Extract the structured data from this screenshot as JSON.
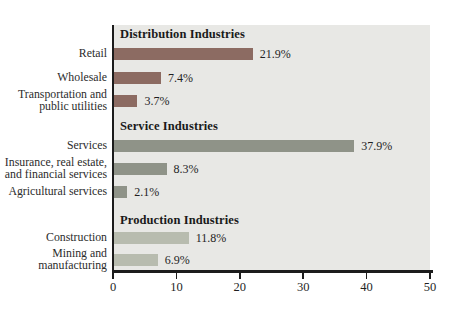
{
  "chart_data": {
    "type": "bar",
    "orientation": "horizontal",
    "title": "",
    "xlabel": "",
    "ylabel": "",
    "xlim": [
      0,
      50
    ],
    "x_ticks": [
      0,
      10,
      20,
      30,
      40,
      50
    ],
    "x_tick_labels": [
      "0",
      "10",
      "20",
      "30",
      "40",
      "50"
    ],
    "grid": false,
    "legend": "none",
    "plot_bg_color": "#e8e8e5",
    "axis_color": "#1c1c1c",
    "value_suffix": "%",
    "groups": [
      {
        "header": "Distribution Industries",
        "color": "#8c6b62",
        "items": [
          {
            "label": "Retail",
            "value": 21.9,
            "value_label": "21.9%"
          },
          {
            "label": "Wholesale",
            "value": 7.4,
            "value_label": "7.4%"
          },
          {
            "label": "Transportation and\npublic utilities",
            "value": 3.7,
            "value_label": "3.7%"
          }
        ]
      },
      {
        "header": "Service Industries",
        "color": "#8f9388",
        "items": [
          {
            "label": "Services",
            "value": 37.9,
            "value_label": "37.9%"
          },
          {
            "label": "Insurance, real estate,\nand financial services",
            "value": 8.3,
            "value_label": "8.3%"
          },
          {
            "label": "Agricultural services",
            "value": 2.1,
            "value_label": "2.1%"
          }
        ]
      },
      {
        "header": "Production Industries",
        "color": "#b8bcaf",
        "items": [
          {
            "label": "Construction",
            "value": 11.8,
            "value_label": "11.8%"
          },
          {
            "label": "Mining and\nmanufacturing",
            "value": 6.9,
            "value_label": "6.9%"
          }
        ]
      }
    ]
  }
}
